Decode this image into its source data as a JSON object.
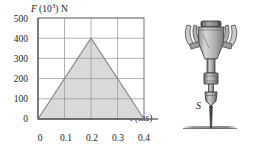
{
  "figure": {
    "background_color": "#ffffff"
  },
  "chart_data": {
    "type": "line",
    "title": "",
    "subtitle": "",
    "ylabel": "F (10^3) N",
    "ylabel_symbol": "F",
    "ylabel_mantissa": "(10",
    "ylabel_exponent": "3",
    "ylabel_suffix": ") N",
    "xlabel": "t (ms)",
    "xlabel_symbol": "t",
    "xlabel_unit": "(ms)",
    "x": [
      0,
      0.2,
      0.4
    ],
    "values": [
      0,
      400,
      0
    ],
    "xticks": [
      "0",
      "0.1",
      "0.2",
      "0.3",
      "0.4"
    ],
    "xtick_values": [
      0,
      0.1,
      0.2,
      0.3,
      0.4
    ],
    "yticks": [
      "0",
      "100",
      "200",
      "300",
      "400",
      "500"
    ],
    "ytick_values": [
      0,
      100,
      200,
      300,
      400,
      500
    ],
    "xlim": [
      0,
      0.4
    ],
    "ylim": [
      0,
      500
    ],
    "grid": true,
    "fill": true,
    "legend": "none",
    "series": [
      {
        "name": "Force pulse",
        "x": [
          0,
          0.2,
          0.4
        ],
        "values": [
          0,
          400,
          0
        ]
      }
    ],
    "peak_point": {
      "x": 0.2,
      "y": 400
    },
    "colors": {
      "fill": "#d9d9d9",
      "line": "#8a8a8a",
      "grid": "#9a9a9a",
      "axis": "#6e6e6e",
      "text": "#1a1a1a"
    }
  },
  "device": {
    "name": "jackhammer-pile-driver",
    "point_label": "S",
    "colors": {
      "body_light": "#cfcfcf",
      "body_mid": "#9e9e9e",
      "body_dark": "#5d5d5d",
      "outline": "#3a3a3a",
      "ground": "#8e8e8e"
    }
  }
}
